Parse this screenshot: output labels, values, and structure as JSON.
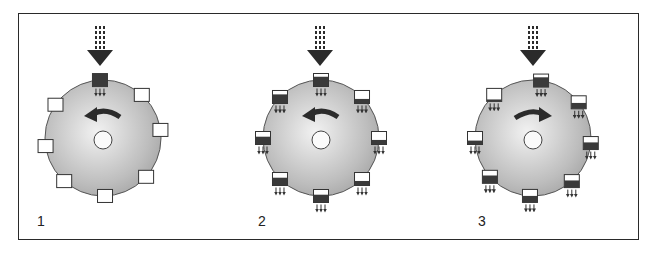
{
  "figure": {
    "panels": [
      {
        "label": "1",
        "center": [
          103,
          138
        ],
        "radius": 58,
        "rotation": "counterclockwise",
        "feed_x": 100,
        "containers": [
          {
            "angle": -93,
            "fill": 1.0,
            "drip": true
          },
          {
            "angle": -48,
            "fill": 0.0,
            "drip": false
          },
          {
            "angle": -8,
            "fill": 0.0,
            "drip": false
          },
          {
            "angle": 42,
            "fill": 0.0,
            "drip": false
          },
          {
            "angle": 88,
            "fill": 0.0,
            "drip": false
          },
          {
            "angle": 132,
            "fill": 0.0,
            "drip": false
          },
          {
            "angle": 172,
            "fill": 0.0,
            "drip": false
          },
          {
            "angle": 215,
            "fill": 0.0,
            "drip": false
          }
        ]
      },
      {
        "label": "2",
        "center": [
          321,
          138
        ],
        "radius": 58,
        "rotation": "counterclockwise",
        "feed_x": 320,
        "containers": [
          {
            "angle": -90,
            "fill": 0.75,
            "drip": true
          },
          {
            "angle": -45,
            "fill": 0.35,
            "drip": true
          },
          {
            "angle": 0,
            "fill": 0.35,
            "drip": true
          },
          {
            "angle": 45,
            "fill": 0.35,
            "drip": true
          },
          {
            "angle": 90,
            "fill": 0.6,
            "drip": true
          },
          {
            "angle": 135,
            "fill": 0.6,
            "drip": true
          },
          {
            "angle": 180,
            "fill": 0.6,
            "drip": true
          },
          {
            "angle": 225,
            "fill": 0.7,
            "drip": true
          }
        ]
      },
      {
        "label": "3",
        "center": [
          533,
          138
        ],
        "radius": 58,
        "rotation": "clockwise",
        "feed_x": 533,
        "containers": [
          {
            "angle": -82,
            "fill": 0.75,
            "drip": true
          },
          {
            "angle": -38,
            "fill": 0.45,
            "drip": true
          },
          {
            "angle": 5,
            "fill": 0.55,
            "drip": true
          },
          {
            "angle": 48,
            "fill": 0.55,
            "drip": true
          },
          {
            "angle": 93,
            "fill": 0.5,
            "drip": true
          },
          {
            "angle": 138,
            "fill": 0.6,
            "drip": true
          },
          {
            "angle": 180,
            "fill": 0.3,
            "drip": true
          },
          {
            "angle": 228,
            "fill": 0.15,
            "drip": true
          }
        ]
      }
    ]
  },
  "colors": {
    "frame": "#2a2a2a",
    "disk_light": "#e6e6e6",
    "disk_dark": "#a6a6a6",
    "disk_edge": "#555555",
    "container_fill": "#3a3a3a",
    "feed_arrow": "#2b2b2b"
  }
}
